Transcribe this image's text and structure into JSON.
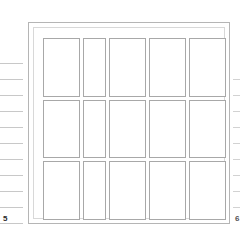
{
  "view": {
    "title": "Page Layout Grid",
    "background_color": "#ffffff",
    "frame_color": "#b5b5b5",
    "inner_frame_color": "#d8d8d8",
    "card_border_color": "#a8a8a8",
    "tick_color": "#c8c8c8"
  },
  "markers": {
    "left_page_label": "5",
    "right_page_label": "6"
  },
  "left_ruler": {
    "name": "left-ruler",
    "tick_color": "#c8c8c8",
    "ticks": [
      {
        "y": 63
      },
      {
        "y": 79
      },
      {
        "y": 95
      },
      {
        "y": 111
      },
      {
        "y": 127
      },
      {
        "y": 143
      },
      {
        "y": 159
      },
      {
        "y": 175
      },
      {
        "y": 191
      },
      {
        "y": 207
      },
      {
        "y": 223
      }
    ]
  },
  "right_ruler": {
    "name": "right-ruler",
    "tick_color": "#d2d2d2",
    "ticks": [
      {
        "y": 79
      },
      {
        "y": 95
      },
      {
        "y": 111
      },
      {
        "y": 127
      },
      {
        "y": 143
      },
      {
        "y": 159
      },
      {
        "y": 175
      },
      {
        "y": 191
      },
      {
        "y": 207
      }
    ]
  },
  "sheet": {
    "name": "sheet-frame",
    "x": 28,
    "y": 22,
    "width": 202,
    "height": 202
  },
  "grid": {
    "columns": 5,
    "rows": 3,
    "column_widths": [
      37,
      23,
      37,
      37,
      37
    ],
    "cells": [
      {
        "row": 1,
        "col": 1,
        "label": "",
        "narrow": false
      },
      {
        "row": 1,
        "col": 2,
        "label": "",
        "narrow": true
      },
      {
        "row": 1,
        "col": 3,
        "label": "",
        "narrow": false
      },
      {
        "row": 1,
        "col": 4,
        "label": "",
        "narrow": false
      },
      {
        "row": 1,
        "col": 5,
        "label": "",
        "narrow": false
      },
      {
        "row": 2,
        "col": 1,
        "label": "",
        "narrow": false
      },
      {
        "row": 2,
        "col": 2,
        "label": "",
        "narrow": true
      },
      {
        "row": 2,
        "col": 3,
        "label": "",
        "narrow": false
      },
      {
        "row": 2,
        "col": 4,
        "label": "",
        "narrow": false
      },
      {
        "row": 2,
        "col": 5,
        "label": "",
        "narrow": false
      },
      {
        "row": 3,
        "col": 1,
        "label": "",
        "narrow": false
      },
      {
        "row": 3,
        "col": 2,
        "label": "",
        "narrow": true
      },
      {
        "row": 3,
        "col": 3,
        "label": "",
        "narrow": false
      },
      {
        "row": 3,
        "col": 4,
        "label": "",
        "narrow": false
      },
      {
        "row": 3,
        "col": 5,
        "label": "",
        "narrow": false
      }
    ]
  }
}
